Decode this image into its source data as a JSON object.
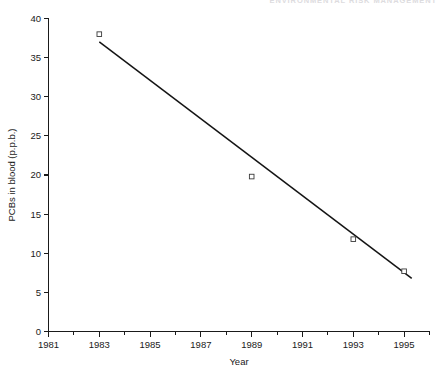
{
  "page": {
    "header_text_partial": "ENVIRONMENTAL RISK MANAGEMENT"
  },
  "chart_data": {
    "type": "scatter",
    "title": "",
    "xlabel": "Year",
    "ylabel": "PCBs in blood (p.p.b.)",
    "xlim": [
      1981,
      1996
    ],
    "ylim": [
      0,
      40
    ],
    "grid": false,
    "legend": "none",
    "x_ticks_major": [
      1981,
      1983,
      1985,
      1987,
      1989,
      1991,
      1993,
      1995
    ],
    "x_tick_labels": [
      "1981",
      "1983",
      "1985",
      "1987",
      "1989",
      "1991",
      "1993",
      "1995"
    ],
    "x_ticks_minor": [
      1982,
      1984,
      1986,
      1988,
      1990,
      1992,
      1994,
      1996
    ],
    "y_ticks": [
      0,
      5,
      10,
      15,
      20,
      25,
      30,
      35,
      40
    ],
    "y_tick_labels": [
      "0",
      "5",
      "10",
      "15",
      "20",
      "25",
      "30",
      "35",
      "40"
    ],
    "series": [
      {
        "name": "PCBs in blood",
        "type": "scatter",
        "marker": "open-square",
        "x": [
          1983,
          1989,
          1993,
          1995
        ],
        "values": [
          38.0,
          19.8,
          11.8,
          7.7
        ]
      },
      {
        "name": "Fitted trend line",
        "type": "line",
        "x": [
          1983.0,
          1995.3
        ],
        "values": [
          37.0,
          6.8
        ]
      }
    ],
    "colors": {
      "axis": "#1a1a1a",
      "line": "#141414",
      "marker_stroke": "#3a3a3a",
      "marker_fill": "#ffffff",
      "background": "#ffffff"
    }
  }
}
